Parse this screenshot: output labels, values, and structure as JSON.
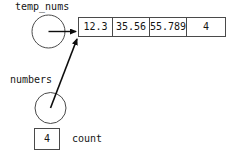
{
  "diagram": {
    "pointers": [
      {
        "id": "temp_nums",
        "label": "temp_nums",
        "shape": "circle",
        "target": "array-cell-0"
      },
      {
        "id": "numbers",
        "label": "numbers",
        "shape": "circle",
        "target": "array-cell-0"
      }
    ],
    "array": {
      "name": "value-array",
      "cells": [
        {
          "value": "12.3"
        },
        {
          "value": "35.56"
        },
        {
          "value": "55.789"
        },
        {
          "value": "4"
        }
      ]
    },
    "count": {
      "label": "count",
      "value": "4"
    },
    "bottom_cut_text": "",
    "colors": {
      "stroke": "#4a4a4a",
      "arrow": "#0d0d0d",
      "text": "#151515",
      "background": "#ffffff"
    }
  }
}
